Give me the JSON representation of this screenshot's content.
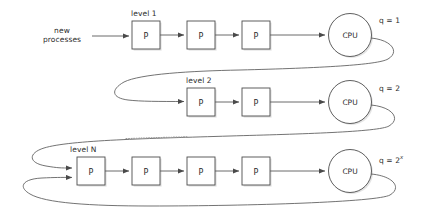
{
  "diagram": {
    "input_label": {
      "line1": "new",
      "line2": "processes"
    },
    "colors": {
      "background": "#ffffff",
      "stroke": "#5a5a5a",
      "box_fill": "#ffffff",
      "box_stroke": "#4d4d4d",
      "shadow": "#c9c9c9",
      "text": "#2b2b2b"
    },
    "process_box_label": "P",
    "cpu_label": "CPU",
    "levels": [
      {
        "id": "level-1",
        "label": "level 1",
        "label_italic_part": "",
        "process_count": 3,
        "quantum_label": "q = 1",
        "quantum_prefix": "q = ",
        "quantum_value": "1",
        "quantum_exponent": ""
      },
      {
        "id": "level-2",
        "label": "level 2",
        "label_italic_part": "",
        "process_count": 2,
        "quantum_label": "q = 2",
        "quantum_prefix": "q = ",
        "quantum_value": "2",
        "quantum_exponent": ""
      },
      {
        "id": "level-n",
        "label": "level N",
        "label_italic_part": "N",
        "process_count": 4,
        "quantum_label": "q = 2x",
        "quantum_prefix": "q = ",
        "quantum_value": "2",
        "quantum_exponent": "x"
      }
    ],
    "ellipsis_hint": "dotted line indicating omitted intermediate levels"
  }
}
